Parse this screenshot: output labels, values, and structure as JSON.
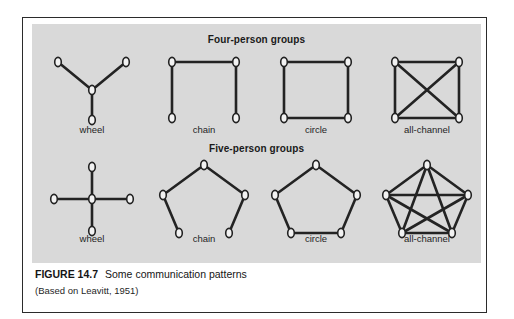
{
  "figure": {
    "caption_number": "FIGURE 14.7",
    "caption_title": "Some communication patterns",
    "caption_source": "(Based on Leavitt, 1951)"
  },
  "sections": [
    {
      "id": "four",
      "title": "Four-person groups"
    },
    {
      "id": "five",
      "title": "Five-person groups"
    }
  ],
  "labels": {
    "wheel": "wheel",
    "chain": "chain",
    "circle": "circle",
    "all_channel": "all-channel"
  },
  "colors": {
    "panel_background": "#d9d9d9",
    "page_background": "#ffffff",
    "border": "#2b2b2b",
    "edge": "#232323",
    "node_fill": "#f2f2f2",
    "text": "#1a1a1a"
  },
  "chart_data": {
    "type": "diagram",
    "title": "Some communication patterns",
    "subtitle": "(Based on Leavitt, 1951)",
    "diagram_kind": "network-graph-grid",
    "grid": {
      "rows": 2,
      "columns": 4
    },
    "row_titles": [
      "Four-person groups",
      "Five-person groups"
    ],
    "column_labels": [
      "wheel",
      "chain",
      "circle",
      "all-channel"
    ],
    "graphs": [
      {
        "group": "Four-person groups",
        "name": "wheel",
        "node_count": 4,
        "edge_count": 3,
        "nodes": [
          {
            "id": 0,
            "x": 56,
            "y": 42
          },
          {
            "id": 1,
            "x": 22,
            "y": 14
          },
          {
            "id": 2,
            "x": 90,
            "y": 14
          },
          {
            "id": 3,
            "x": 56,
            "y": 72
          }
        ],
        "edges": [
          [
            0,
            1
          ],
          [
            0,
            2
          ],
          [
            0,
            3
          ]
        ]
      },
      {
        "group": "Four-person groups",
        "name": "chain",
        "node_count": 4,
        "edge_count": 3,
        "nodes": [
          {
            "id": 0,
            "x": 24,
            "y": 14
          },
          {
            "id": 1,
            "x": 88,
            "y": 14
          },
          {
            "id": 2,
            "x": 88,
            "y": 70
          },
          {
            "id": 3,
            "x": 24,
            "y": 70
          }
        ],
        "edges": [
          [
            3,
            0
          ],
          [
            0,
            1
          ],
          [
            1,
            2
          ]
        ]
      },
      {
        "group": "Four-person groups",
        "name": "circle",
        "node_count": 4,
        "edge_count": 4,
        "nodes": [
          {
            "id": 0,
            "x": 24,
            "y": 14
          },
          {
            "id": 1,
            "x": 88,
            "y": 14
          },
          {
            "id": 2,
            "x": 88,
            "y": 70
          },
          {
            "id": 3,
            "x": 24,
            "y": 70
          }
        ],
        "edges": [
          [
            0,
            1
          ],
          [
            1,
            2
          ],
          [
            2,
            3
          ],
          [
            3,
            0
          ]
        ]
      },
      {
        "group": "Four-person groups",
        "name": "all-channel",
        "node_count": 4,
        "edge_count": 6,
        "nodes": [
          {
            "id": 0,
            "x": 24,
            "y": 14
          },
          {
            "id": 1,
            "x": 88,
            "y": 14
          },
          {
            "id": 2,
            "x": 88,
            "y": 70
          },
          {
            "id": 3,
            "x": 24,
            "y": 70
          }
        ],
        "edges": [
          [
            0,
            1
          ],
          [
            1,
            2
          ],
          [
            2,
            3
          ],
          [
            3,
            0
          ],
          [
            0,
            2
          ],
          [
            1,
            3
          ]
        ]
      },
      {
        "group": "Five-person groups",
        "name": "wheel",
        "node_count": 5,
        "edge_count": 4,
        "nodes": [
          {
            "id": 0,
            "x": 56,
            "y": 42
          },
          {
            "id": 1,
            "x": 56,
            "y": 10
          },
          {
            "id": 2,
            "x": 56,
            "y": 74
          },
          {
            "id": 3,
            "x": 18,
            "y": 42
          },
          {
            "id": 4,
            "x": 94,
            "y": 42
          }
        ],
        "edges": [
          [
            0,
            1
          ],
          [
            0,
            2
          ],
          [
            0,
            3
          ],
          [
            0,
            4
          ]
        ]
      },
      {
        "group": "Five-person groups",
        "name": "chain",
        "node_count": 5,
        "edge_count": 4,
        "nodes": [
          {
            "id": 0,
            "x": 56,
            "y": 8
          },
          {
            "id": 1,
            "x": 97,
            "y": 38
          },
          {
            "id": 2,
            "x": 81,
            "y": 76
          },
          {
            "id": 3,
            "x": 31,
            "y": 76
          },
          {
            "id": 4,
            "x": 15,
            "y": 38
          }
        ],
        "edges": [
          [
            0,
            1
          ],
          [
            1,
            2
          ],
          [
            3,
            4
          ],
          [
            4,
            0
          ]
        ]
      },
      {
        "group": "Five-person groups",
        "name": "circle",
        "node_count": 5,
        "edge_count": 5,
        "nodes": [
          {
            "id": 0,
            "x": 56,
            "y": 8
          },
          {
            "id": 1,
            "x": 97,
            "y": 38
          },
          {
            "id": 2,
            "x": 81,
            "y": 76
          },
          {
            "id": 3,
            "x": 31,
            "y": 76
          },
          {
            "id": 4,
            "x": 15,
            "y": 38
          }
        ],
        "edges": [
          [
            0,
            1
          ],
          [
            1,
            2
          ],
          [
            2,
            3
          ],
          [
            3,
            4
          ],
          [
            4,
            0
          ]
        ]
      },
      {
        "group": "Five-person groups",
        "name": "all-channel",
        "node_count": 5,
        "edge_count": 10,
        "nodes": [
          {
            "id": 0,
            "x": 56,
            "y": 8
          },
          {
            "id": 1,
            "x": 97,
            "y": 38
          },
          {
            "id": 2,
            "x": 81,
            "y": 76
          },
          {
            "id": 3,
            "x": 31,
            "y": 76
          },
          {
            "id": 4,
            "x": 15,
            "y": 38
          }
        ],
        "edges": [
          [
            0,
            1
          ],
          [
            1,
            2
          ],
          [
            2,
            3
          ],
          [
            3,
            4
          ],
          [
            4,
            0
          ],
          [
            0,
            2
          ],
          [
            0,
            3
          ],
          [
            1,
            3
          ],
          [
            1,
            4
          ],
          [
            2,
            4
          ]
        ]
      }
    ]
  }
}
